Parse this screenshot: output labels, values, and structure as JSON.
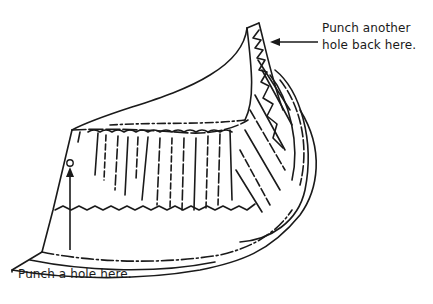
{
  "figure": {
    "stroke_color": "#1a1a1a",
    "background": "#ffffff"
  },
  "callouts": {
    "top": {
      "line1": "Punch another",
      "line2": "hole back here."
    },
    "bottom": {
      "text": "Punch a hole here."
    }
  },
  "icons": {
    "arrow_top": "arrow-left-icon",
    "arrow_bottom": "arrow-up-icon",
    "hole_marker": "circle-hole-icon"
  }
}
